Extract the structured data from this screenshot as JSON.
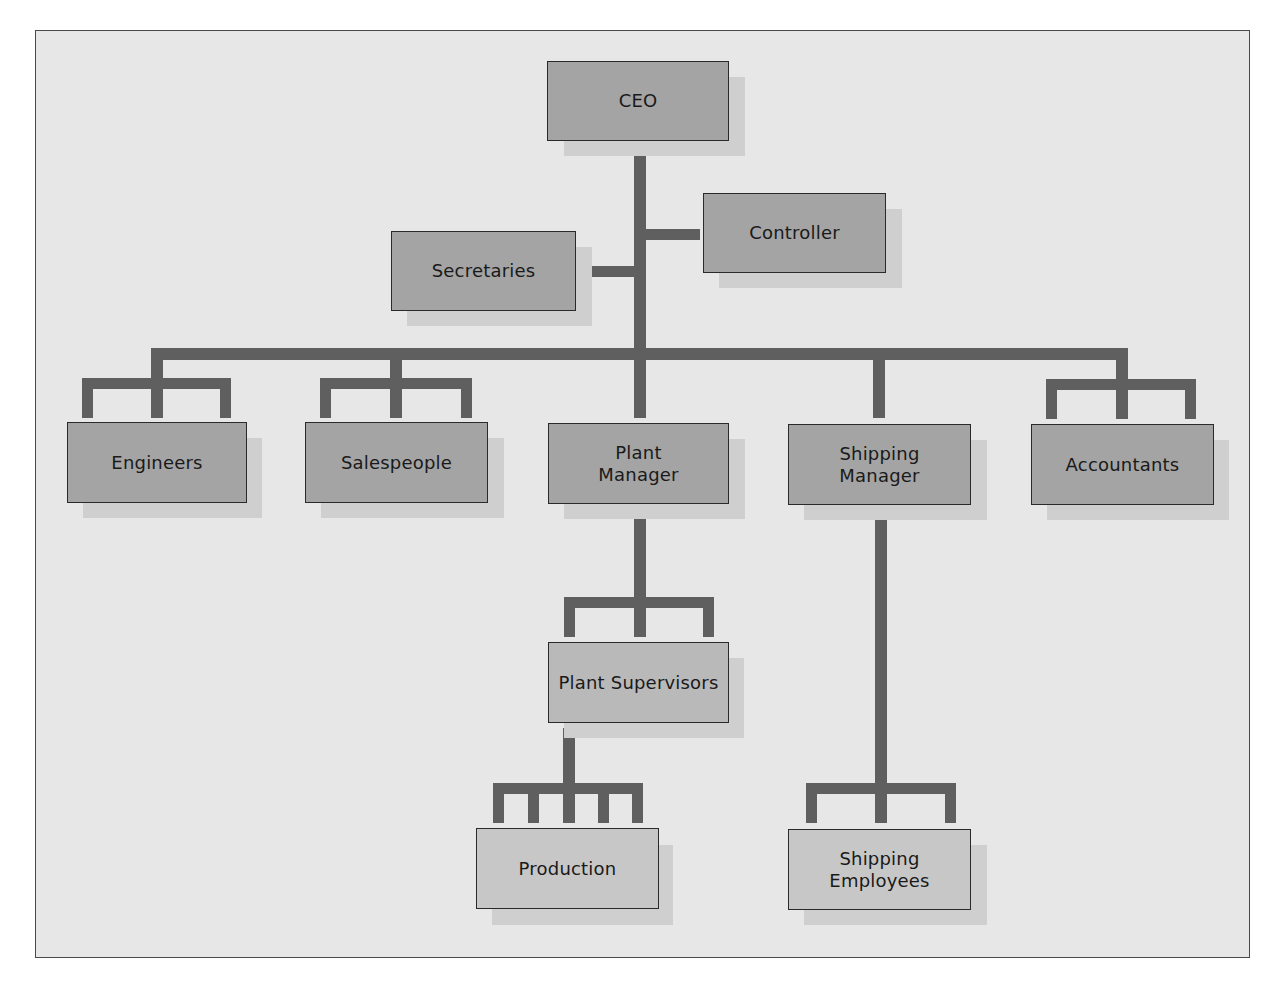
{
  "diagram": {
    "type": "org-chart",
    "colors": {
      "background": "#e7e7e7",
      "connector": "#5f5f5f",
      "box_dark": "#a4a4a4",
      "box_mid": "#b9b9b9",
      "box_light": "#c7c7c7",
      "shadow": "#cfcfcf",
      "border": "#2a2a2a"
    },
    "nodes": {
      "ceo": "CEO",
      "controller": "Controller",
      "secretaries": "Secretaries",
      "engineers": "Engineers",
      "salespeople": "Salespeople",
      "plant_manager": "Plant\nManager",
      "shipping_manager": "Shipping\nManager",
      "accountants": "Accountants",
      "plant_supervisors": "Plant Supervisors",
      "production": "Production",
      "shipping_employees": "Shipping\nEmployees"
    },
    "edges": [
      [
        "CEO",
        "Controller"
      ],
      [
        "CEO",
        "Secretaries"
      ],
      [
        "CEO",
        "Engineers"
      ],
      [
        "CEO",
        "Salespeople"
      ],
      [
        "CEO",
        "Plant Manager"
      ],
      [
        "CEO",
        "Shipping Manager"
      ],
      [
        "CEO",
        "Accountants"
      ],
      [
        "Plant Manager",
        "Plant Supervisors"
      ],
      [
        "Plant Supervisors",
        "Production"
      ],
      [
        "Shipping Manager",
        "Shipping Employees"
      ]
    ],
    "fork_prong_counts": {
      "engineers": 3,
      "salespeople": 3,
      "accountants": 3,
      "plant_supervisors": 3,
      "production": 5,
      "shipping_employees": 3
    }
  }
}
